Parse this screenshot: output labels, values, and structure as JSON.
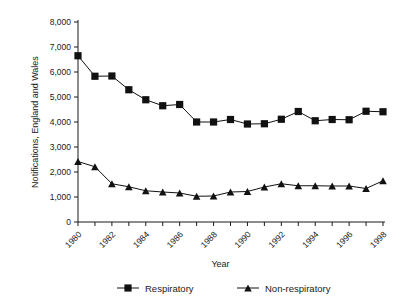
{
  "chart_data": {
    "type": "line",
    "title": "",
    "xlabel": "Year",
    "ylabel": "Notifications, England and Wales",
    "x": [
      1980,
      1981,
      1982,
      1983,
      1984,
      1985,
      1986,
      1987,
      1988,
      1989,
      1990,
      1991,
      1992,
      1993,
      1994,
      1995,
      1996,
      1997,
      1998
    ],
    "xlim": [
      1980,
      1998
    ],
    "ylim": [
      0,
      8000
    ],
    "yticks": [
      0,
      1000,
      2000,
      3000,
      4000,
      5000,
      6000,
      7000,
      8000
    ],
    "ytick_labels": [
      "0",
      "1,000",
      "2,000",
      "3,000",
      "4,000",
      "5,000",
      "6,000",
      "7,000",
      "8,000"
    ],
    "xtick_values": [
      1980,
      1982,
      1984,
      1986,
      1988,
      1990,
      1992,
      1994,
      1996,
      1998
    ],
    "xtick_labels": [
      "1980",
      "1982",
      "1984",
      "1986",
      "1988",
      "1990",
      "1992",
      "1994",
      "1996",
      "1998"
    ],
    "xtick_rotation": -45,
    "grid": false,
    "legend_position": "bottom",
    "series": [
      {
        "name": "Respiratory",
        "marker": "square",
        "color": "#111111",
        "values": [
          6650,
          5830,
          5840,
          5290,
          4890,
          4650,
          4700,
          4000,
          4000,
          4100,
          3920,
          3930,
          4110,
          4420,
          4050,
          4100,
          4090,
          4430,
          4410
        ]
      },
      {
        "name": "Non-respiratory",
        "marker": "triangle",
        "color": "#111111",
        "values": [
          2420,
          2210,
          1530,
          1410,
          1250,
          1200,
          1160,
          1030,
          1040,
          1200,
          1220,
          1400,
          1530,
          1450,
          1450,
          1440,
          1440,
          1340,
          1650
        ]
      }
    ]
  },
  "legend": {
    "items": [
      {
        "label": "Respiratory",
        "marker": "square"
      },
      {
        "label": "Non-respiratory",
        "marker": "triangle"
      }
    ]
  }
}
